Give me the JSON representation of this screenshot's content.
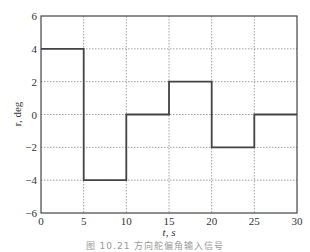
{
  "chart_data": {
    "type": "line",
    "style": "step",
    "title": "",
    "xlabel": "t, s",
    "ylabel": "r, deg",
    "xlim": [
      0,
      30
    ],
    "ylim": [
      -6,
      6
    ],
    "xticks": [
      0,
      5,
      10,
      15,
      20,
      25,
      30
    ],
    "yticks": [
      -6,
      -4,
      -2,
      0,
      2,
      4,
      6
    ],
    "grid": true,
    "legend": null,
    "series": [
      {
        "name": "r",
        "x": [
          0,
          5,
          5,
          10,
          10,
          15,
          15,
          20,
          20,
          25,
          25,
          30
        ],
        "y": [
          4,
          4,
          -4,
          -4,
          0,
          0,
          2,
          2,
          -2,
          -2,
          0,
          0
        ]
      }
    ]
  },
  "caption": "图 10.21  方向舵偏角输入信号"
}
